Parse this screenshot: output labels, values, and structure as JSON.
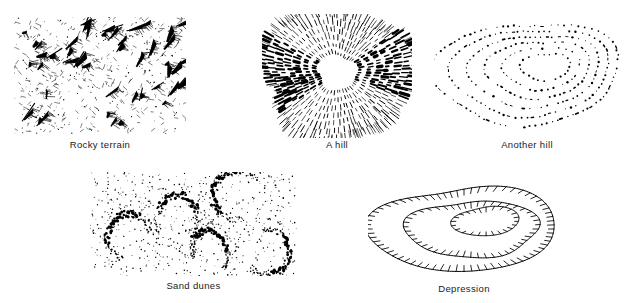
{
  "figure": {
    "background_color": "#ffffff",
    "ink_color": "#000000",
    "caption_color": "#1a1a1a",
    "width": 632,
    "height": 303
  },
  "panels": [
    {
      "id": "rocky-terrain",
      "caption": "Rocky terrain",
      "technique": "hachured-rock-drawing",
      "x": 14,
      "y": 17,
      "width": 172,
      "height": 117,
      "caption_y": 139,
      "seed": 1207,
      "params": {
        "crag_count": 46,
        "fleck_count": 520,
        "stroke_width": 0.8
      }
    },
    {
      "id": "a-hill",
      "caption": "A hill",
      "technique": "radial-hachures",
      "x": 262,
      "y": 14,
      "width": 150,
      "height": 124,
      "caption_y": 139,
      "seed": 4471,
      "params": {
        "ring_count": 7,
        "spokes_per_ring": 88,
        "stroke_width": 0.75
      }
    },
    {
      "id": "another-hill",
      "caption": "Another hill",
      "technique": "dotted-contours",
      "x": 434,
      "y": 18,
      "width": 186,
      "height": 122,
      "caption_y": 139,
      "seed": 9123,
      "params": {
        "contour_count": 6,
        "dot_spacing": 5.2,
        "dot_radius": 0.85
      }
    },
    {
      "id": "sand-dunes",
      "caption": "Sand dunes",
      "technique": "stipple-crescents",
      "x": 90,
      "y": 172,
      "width": 207,
      "height": 104,
      "caption_y": 280,
      "seed": 6610,
      "params": {
        "dune_count": 5,
        "scatter_dots": 430,
        "crescent_dots": 120
      }
    },
    {
      "id": "depression",
      "caption": "Depression",
      "technique": "hachured-depression-contours",
      "x": 368,
      "y": 178,
      "width": 192,
      "height": 102,
      "caption_y": 283,
      "seed": 3388,
      "params": {
        "contour_count": 3,
        "tick_length": 6,
        "tick_spacing": 6.5,
        "stroke_width": 1.0
      }
    }
  ]
}
